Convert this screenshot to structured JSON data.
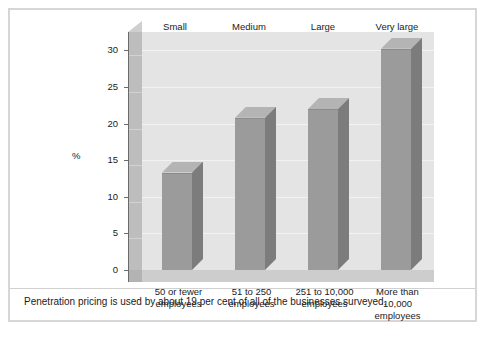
{
  "figure": {
    "caption": "Penetration pricing is used by about 19 per cent of all of the businesses surveyed.",
    "border_color": "#d6d6d6",
    "background": "#ffffff"
  },
  "chart_data": {
    "type": "bar",
    "title": "",
    "xlabel": "",
    "ylabel": "%",
    "ylim": [
      0,
      32.5
    ],
    "yticks": [
      0,
      5,
      10,
      15,
      20,
      25,
      30
    ],
    "ytick_labels": [
      "0",
      "5",
      "10",
      "15",
      "20",
      "25",
      "30"
    ],
    "grid": true,
    "legend": "none",
    "style": "3d-column",
    "bar_color": "#9b9b9b",
    "bar_side_color": "#7c7c7c",
    "bar_top_color": "#b4b4b4",
    "plot_background": "#e4e4e4",
    "group_headers": [
      "Small",
      "Medium",
      "Large",
      "Very large"
    ],
    "categories": [
      "50 or fewer\nemployees",
      "51 to 250\nemployees",
      "251 to 10,000\nemployees",
      "More than\n10,000\nemployees"
    ],
    "values": [
      13.3,
      20.8,
      22.0,
      30.2
    ]
  },
  "axis": {
    "y_title": "%"
  }
}
